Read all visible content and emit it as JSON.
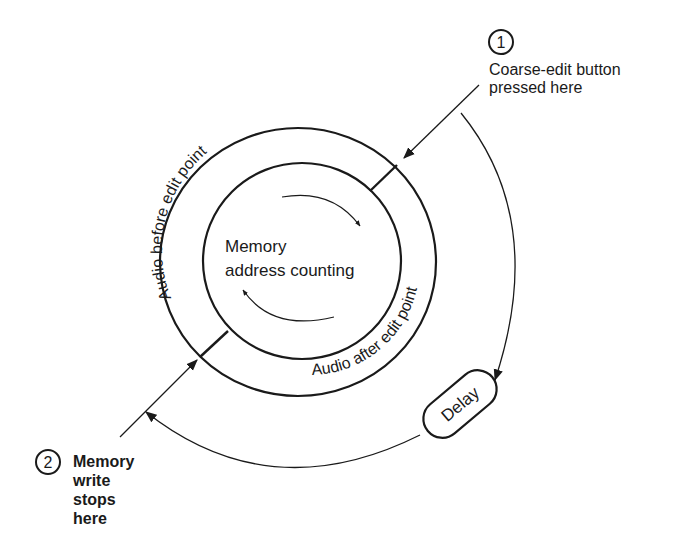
{
  "diagram": {
    "center_text": [
      "Memory",
      "address counting"
    ],
    "ring_outer_label": "Audio before edit point",
    "ring_inner_label": "Audio after edit point",
    "delay_label": "Delay",
    "step1": {
      "number": "1",
      "lines": [
        "Coarse-edit button",
        "pressed here"
      ]
    },
    "step2": {
      "number": "2",
      "lines": [
        "Memory",
        "write",
        "stops",
        "here"
      ]
    },
    "colors": {
      "ink": "#1a1a1a",
      "background": "#ffffff"
    }
  }
}
